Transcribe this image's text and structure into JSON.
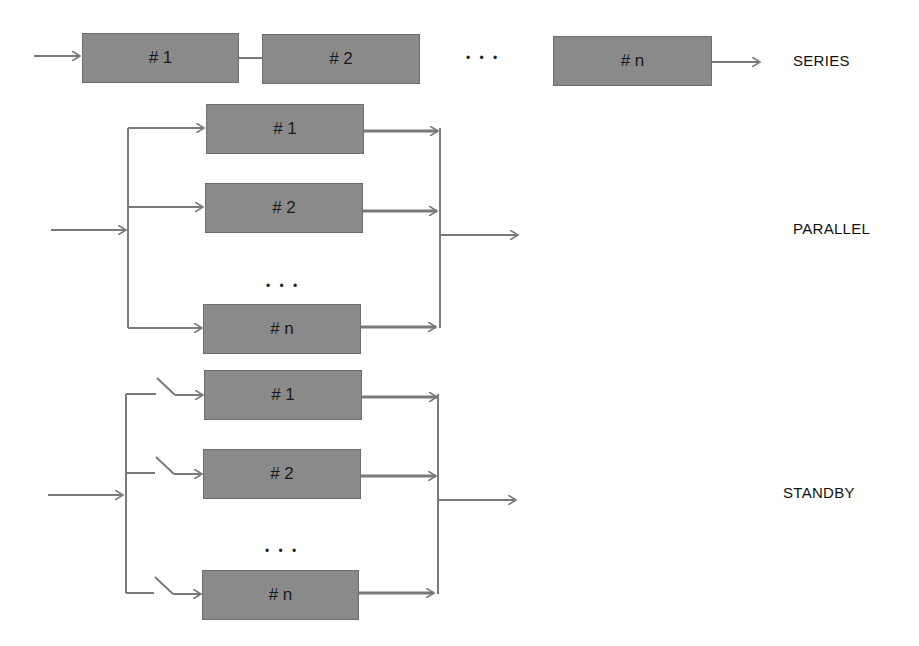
{
  "colors": {
    "box_fill": "#8a8a8a",
    "line": "#7a7a7a",
    "text": "#111111"
  },
  "series": {
    "label": "SERIES",
    "boxes": [
      {
        "label": "# 1"
      },
      {
        "label": "# 2"
      },
      {
        "label": "# n"
      }
    ],
    "ellipsis": "• • •"
  },
  "parallel": {
    "label": "PARALLEL",
    "boxes": [
      {
        "label": "# 1"
      },
      {
        "label": "# 2"
      },
      {
        "label": "# n"
      }
    ],
    "ellipsis": "• • •"
  },
  "standby": {
    "label": "STANDBY",
    "boxes": [
      {
        "label": "# 1"
      },
      {
        "label": "# 2"
      },
      {
        "label": "# n"
      }
    ],
    "ellipsis": "• • •",
    "switches": 3
  }
}
